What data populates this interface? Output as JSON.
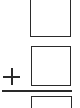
{
  "problem": {
    "type": "vertical-addition",
    "operator": "+",
    "addend_1": "",
    "addend_2": "",
    "sum": ""
  },
  "colors": {
    "stroke": "#2a2a2a",
    "background": "#ffffff"
  }
}
